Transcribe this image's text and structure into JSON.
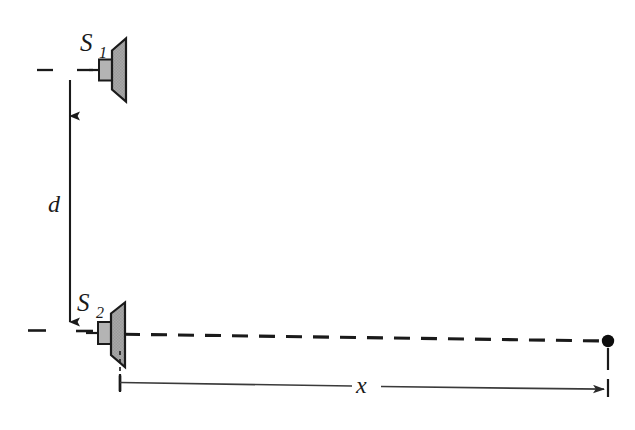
{
  "figure": {
    "type": "physics-diagram",
    "background_color": "#ffffff",
    "width": 635,
    "height": 430
  },
  "labels": {
    "source_1": {
      "symbol": "S",
      "subscript": "1",
      "full": "S1",
      "x": 80,
      "y": 50
    },
    "source_2": {
      "symbol": "S",
      "subscript": "2",
      "full": "S2",
      "x": 78,
      "y": 310
    },
    "separation": {
      "symbol": "d",
      "x": 56,
      "y": 210
    },
    "distance": {
      "symbol": "x",
      "x": 365,
      "y": 391
    }
  },
  "elements": {
    "speaker_1": {
      "name": "speaker-s1",
      "cone_fill": "#a8a8a8",
      "magnet_fill": "#b4b4b4",
      "stroke": "#1a1a1a",
      "center_y": 70,
      "faces": "right"
    },
    "speaker_2": {
      "name": "speaker-s2",
      "cone_fill": "#a8a8a8",
      "magnet_fill": "#b4b4b4",
      "stroke": "#1a1a1a",
      "center_y": 335,
      "faces": "right"
    },
    "observation_point": {
      "name": "observation-point-dot",
      "fill": "#0d0d0d",
      "x": 608,
      "y": 341,
      "radius": 6
    },
    "axis_line_s1": {
      "style": "dashed",
      "color": "#1a1a1a",
      "y": 70
    },
    "axis_line_s2": {
      "style": "dashed",
      "color": "#1a1a1a",
      "from_x": 28,
      "to_x": 608,
      "y_start": 331,
      "y_end": 341
    },
    "separation_arrow": {
      "name": "separation-dimension-arrow",
      "orientation": "vertical",
      "double_headed": true,
      "x": 70,
      "y_top": 66,
      "y_bottom": 333,
      "color": "#1a1a1a"
    },
    "distance_arrow": {
      "name": "distance-dimension-arrow",
      "orientation": "horizontal",
      "double_headed": false,
      "x_start": 120,
      "x_end": 606,
      "y_start": 382,
      "y_end": 389,
      "color": "#3a3a3a"
    }
  },
  "colors": {
    "ink": "#1a1a1a",
    "cone_gray": "#a8a8a8",
    "magnet_gray": "#b4b4b4",
    "dot_black": "#0d0d0d",
    "thin_rule": "#3a3a3a",
    "page_white": "#ffffff"
  }
}
